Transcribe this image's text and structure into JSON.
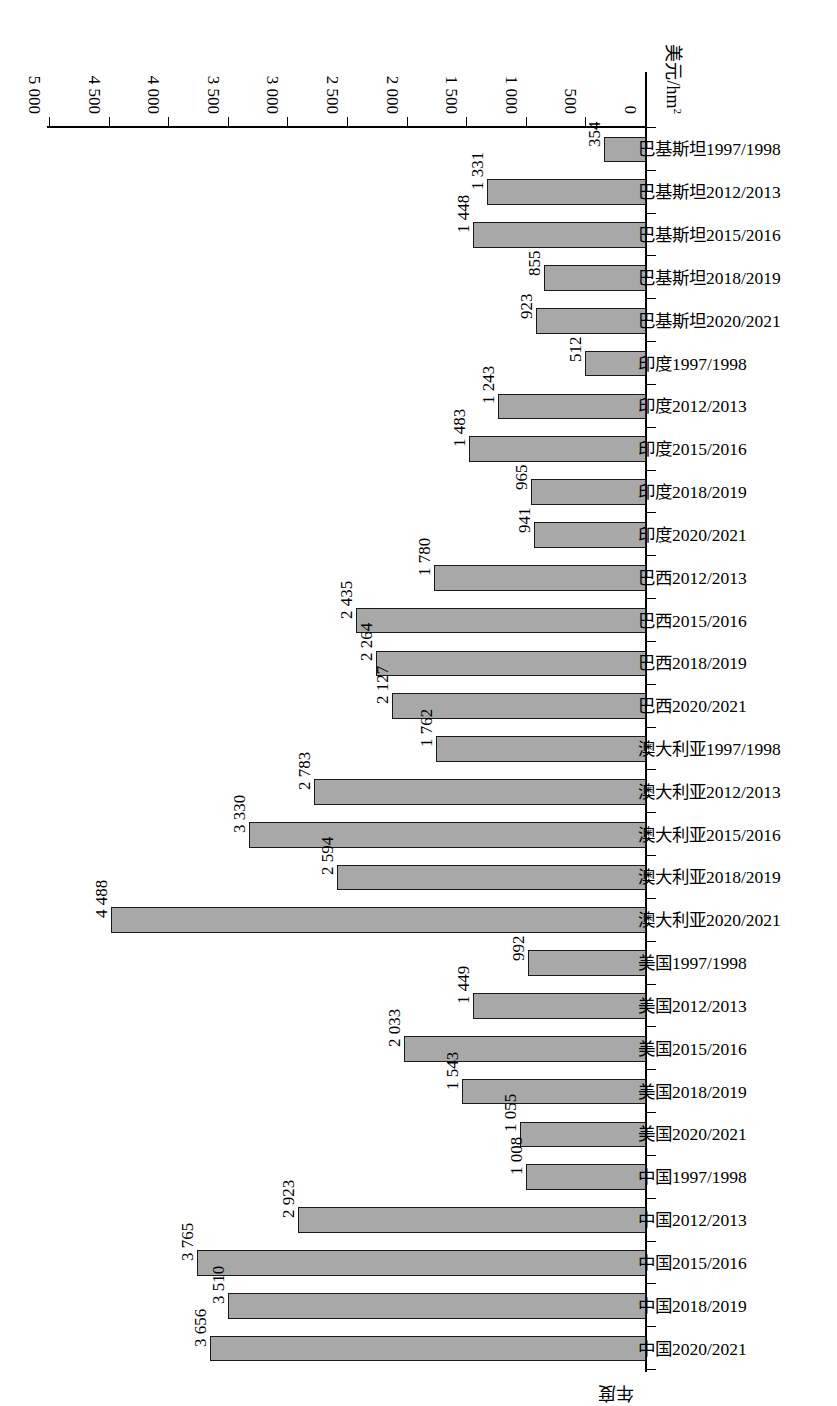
{
  "chart_data": {
    "type": "bar",
    "orientation": "horizontal",
    "title": "",
    "xlabel": "美元/hm²",
    "ylabel": "年度",
    "xlim": [
      0,
      5000
    ],
    "xticks": [
      "0",
      "500",
      "1 000",
      "1 500",
      "2 000",
      "2 500",
      "3 000",
      "3 500",
      "4 000",
      "4 500",
      "5 000"
    ],
    "xtick_values": [
      0,
      500,
      1000,
      1500,
      2000,
      2500,
      3000,
      3500,
      4000,
      4500,
      5000
    ],
    "grid": false,
    "legend": "none",
    "bar_fill": "#a8a8a8",
    "bar_stroke": "#1a1a1a",
    "categories": [
      "中国2020/2021",
      "中国2018/2019",
      "中国2015/2016",
      "中国2012/2013",
      "中国1997/1998",
      "美国2020/2021",
      "美国2018/2019",
      "美国2015/2016",
      "美国2012/2013",
      "美国1997/1998",
      "澳大利亚2020/2021",
      "澳大利亚2018/2019",
      "澳大利亚2015/2016",
      "澳大利亚2012/2013",
      "澳大利亚1997/1998",
      "巴西2020/2021",
      "巴西2018/2019",
      "巴西2015/2016",
      "巴西2012/2013",
      "印度2020/2021",
      "印度2018/2019",
      "印度2015/2016",
      "印度2012/2013",
      "印度1997/1998",
      "巴基斯坦2020/2021",
      "巴基斯坦2018/2019",
      "巴基斯坦2015/2016",
      "巴基斯坦2012/2013",
      "巴基斯坦1997/1998"
    ],
    "values": [
      3656,
      3510,
      3765,
      2923,
      1008,
      1055,
      1543,
      2033,
      1449,
      992,
      4488,
      2594,
      3330,
      2783,
      1762,
      2127,
      2264,
      2435,
      1780,
      941,
      965,
      1483,
      1243,
      512,
      923,
      855,
      1448,
      1331,
      354
    ],
    "value_labels": [
      "3 656",
      "3 510",
      "3 765",
      "2 923",
      "1 008",
      "1 055",
      "1 543",
      "2 033",
      "1 449",
      "992",
      "4 488",
      "2 594",
      "3 330",
      "2 783",
      "1 762",
      "2 127",
      "2 264",
      "2 435",
      "1 780",
      "941",
      "965",
      "1 483",
      "1 243",
      "512",
      "923",
      "855",
      "1 448",
      "1 331",
      "354"
    ]
  }
}
